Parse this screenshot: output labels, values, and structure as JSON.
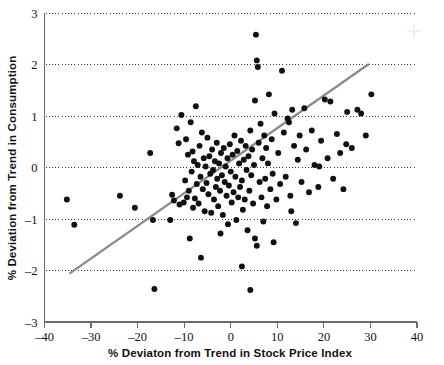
{
  "chart_data": {
    "type": "scatter",
    "title": "",
    "subtitle": "",
    "xlabel": "% Deviaton from Trend in Stock Price Index",
    "ylabel": "% Deviation from Trend in Consumption",
    "xlim": [
      -40,
      40
    ],
    "ylim": [
      -3,
      3
    ],
    "xticks": [
      -40,
      -30,
      -20,
      -10,
      0,
      10,
      20,
      30,
      40
    ],
    "xticklabels": [
      "–40",
      "–30",
      "–20",
      "–10",
      "0",
      "10",
      "20",
      "30",
      "40"
    ],
    "yticks": [
      -3,
      -2,
      -1,
      0,
      1,
      2,
      3
    ],
    "yticklabels": [
      "–3",
      "–2",
      "–1",
      "0",
      "1",
      "2",
      "3"
    ],
    "grid": {
      "horizontal": true,
      "vertical": false,
      "style": "dotted",
      "levels": [
        -2,
        -1,
        0,
        1,
        2,
        3
      ]
    },
    "legend": {
      "visible": false,
      "position": "none"
    },
    "marker": {
      "shape": "circle",
      "color": "#111111",
      "size": 4.0
    },
    "trendline": {
      "visible": true,
      "color": "#8a8a8a",
      "x_start": -34.5,
      "y_start": -2.05,
      "x_end": 29.5,
      "y_end": 2.0,
      "slope": 0.0633,
      "intercept": 0.133
    },
    "series": [
      {
        "name": "Observations",
        "points": [
          [
            -35.2,
            -0.62
          ],
          [
            -33.6,
            -1.11
          ],
          [
            -23.8,
            -0.55
          ],
          [
            -20.6,
            -0.78
          ],
          [
            -16.7,
            -1.02
          ],
          [
            -16.4,
            -2.36
          ],
          [
            -17.3,
            0.28
          ],
          [
            -13.0,
            -1.02
          ],
          [
            -12.6,
            -0.53
          ],
          [
            -12.2,
            -0.64
          ],
          [
            -11.6,
            0.76
          ],
          [
            -11.2,
            0.47
          ],
          [
            -11.0,
            -0.72
          ],
          [
            -10.6,
            1.02
          ],
          [
            -10.1,
            -0.68
          ],
          [
            -9.8,
            -0.25
          ],
          [
            -9.6,
            0.55
          ],
          [
            -9.4,
            -0.58
          ],
          [
            -9.2,
            0.25
          ],
          [
            -9.0,
            -0.45
          ],
          [
            -8.8,
            -1.38
          ],
          [
            -8.6,
            0.88
          ],
          [
            -8.4,
            -0.08
          ],
          [
            -8.2,
            0.31
          ],
          [
            -8.1,
            -0.78
          ],
          [
            -7.9,
            0.12
          ],
          [
            -7.7,
            -0.6
          ],
          [
            -7.5,
            1.19
          ],
          [
            -7.3,
            -0.32
          ],
          [
            -7.1,
            0.05
          ],
          [
            -6.9,
            -0.7
          ],
          [
            -6.7,
            0.42
          ],
          [
            -6.5,
            -0.18
          ],
          [
            -6.4,
            -1.75
          ],
          [
            -6.2,
            0.68
          ],
          [
            -6.0,
            -0.42
          ],
          [
            -5.8,
            0.18
          ],
          [
            -5.6,
            -0.85
          ],
          [
            -5.4,
            0.02
          ],
          [
            -5.2,
            -0.3
          ],
          [
            -5.0,
            0.58
          ],
          [
            -4.8,
            -0.52
          ],
          [
            -4.6,
            0.22
          ],
          [
            -4.4,
            -0.12
          ],
          [
            -4.2,
            -0.88
          ],
          [
            -4.0,
            0.35
          ],
          [
            -3.8,
            -0.05
          ],
          [
            -3.6,
            -0.62
          ],
          [
            -3.4,
            0.12
          ],
          [
            -3.2,
            -0.38
          ],
          [
            -3.0,
            0.48
          ],
          [
            -2.9,
            -0.22
          ],
          [
            -2.7,
            -0.75
          ],
          [
            -2.5,
            0.08
          ],
          [
            -2.3,
            -0.45
          ],
          [
            -2.1,
            0.28
          ],
          [
            -1.9,
            -0.15
          ],
          [
            -1.7,
            -0.92
          ],
          [
            -1.5,
            0.38
          ],
          [
            -1.3,
            -0.28
          ],
          [
            -1.1,
            0.02
          ],
          [
            -0.9,
            -0.55
          ],
          [
            -0.7,
            0.18
          ],
          [
            -0.6,
            -1.1
          ],
          [
            -0.4,
            -0.35
          ],
          [
            -0.2,
            0.45
          ],
          [
            0.0,
            -0.08
          ],
          [
            0.2,
            -0.68
          ],
          [
            0.4,
            0.25
          ],
          [
            0.6,
            -0.48
          ],
          [
            0.8,
            0.62
          ],
          [
            1.0,
            -0.18
          ],
          [
            1.2,
            -1.02
          ],
          [
            1.4,
            0.32
          ],
          [
            1.6,
            -0.58
          ],
          [
            1.8,
            0.08
          ],
          [
            2.0,
            -0.38
          ],
          [
            2.2,
            0.52
          ],
          [
            2.4,
            -0.25
          ],
          [
            2.6,
            -0.82
          ],
          [
            2.8,
            0.15
          ],
          [
            3.0,
            -0.62
          ],
          [
            3.2,
            0.42
          ],
          [
            3.4,
            -0.05
          ],
          [
            3.6,
            -1.22
          ],
          [
            3.8,
            0.22
          ],
          [
            4.0,
            -0.45
          ],
          [
            4.2,
            0.72
          ],
          [
            4.4,
            -0.15
          ],
          [
            4.6,
            0.35
          ],
          [
            4.8,
            -0.7
          ],
          [
            5.0,
            0.05
          ],
          [
            5.2,
            1.3
          ],
          [
            5.4,
            2.58
          ],
          [
            5.6,
            2.08
          ],
          [
            5.8,
            1.95
          ],
          [
            5.2,
            -1.38
          ],
          [
            5.6,
            -1.52
          ],
          [
            4.2,
            -2.38
          ],
          [
            6.0,
            0.48
          ],
          [
            6.2,
            -0.28
          ],
          [
            6.4,
            0.85
          ],
          [
            6.6,
            -0.58
          ],
          [
            6.8,
            0.18
          ],
          [
            7.0,
            -1.05
          ],
          [
            7.2,
            0.62
          ],
          [
            7.4,
            -0.22
          ],
          [
            7.6,
            0.38
          ],
          [
            7.8,
            -0.75
          ],
          [
            8.0,
            0.08
          ],
          [
            8.2,
            1.42
          ],
          [
            8.5,
            -0.42
          ],
          [
            8.8,
            0.55
          ],
          [
            9.0,
            -0.12
          ],
          [
            9.4,
            1.05
          ],
          [
            9.8,
            -0.62
          ],
          [
            10.2,
            0.28
          ],
          [
            10.6,
            -0.32
          ],
          [
            11.0,
            1.88
          ],
          [
            11.4,
            0.68
          ],
          [
            11.8,
            -0.18
          ],
          [
            12.2,
            0.95
          ],
          [
            12.5,
            0.88
          ],
          [
            12.8,
            -0.55
          ],
          [
            13.2,
            1.12
          ],
          [
            13.6,
            0.42
          ],
          [
            14.0,
            -1.08
          ],
          [
            14.4,
            0.15
          ],
          [
            14.8,
            0.62
          ],
          [
            15.2,
            -0.28
          ],
          [
            15.8,
            1.15
          ],
          [
            16.2,
            0.35
          ],
          [
            16.8,
            -0.48
          ],
          [
            17.4,
            0.72
          ],
          [
            18.0,
            0.05
          ],
          [
            18.8,
            -0.38
          ],
          [
            19.4,
            0.52
          ],
          [
            20.2,
            1.32
          ],
          [
            20.8,
            0.18
          ],
          [
            21.4,
            1.28
          ],
          [
            22.0,
            -0.22
          ],
          [
            22.8,
            0.65
          ],
          [
            23.5,
            0.28
          ],
          [
            24.2,
            -0.42
          ],
          [
            25.0,
            1.08
          ],
          [
            26.0,
            0.38
          ],
          [
            27.2,
            1.12
          ],
          [
            28.0,
            1.05
          ],
          [
            29.0,
            0.62
          ],
          [
            30.2,
            1.42
          ],
          [
            24.8,
            0.45
          ],
          [
            19.0,
            0.02
          ],
          [
            13.0,
            -0.85
          ],
          [
            9.2,
            -1.45
          ],
          [
            2.4,
            -1.92
          ],
          [
            -2.2,
            -1.28
          ]
        ]
      }
    ]
  },
  "axis": {
    "x_title": "% Deviaton from Trend in Stock Price Index",
    "y_title": "% Deviation from Trend in Consumption"
  }
}
